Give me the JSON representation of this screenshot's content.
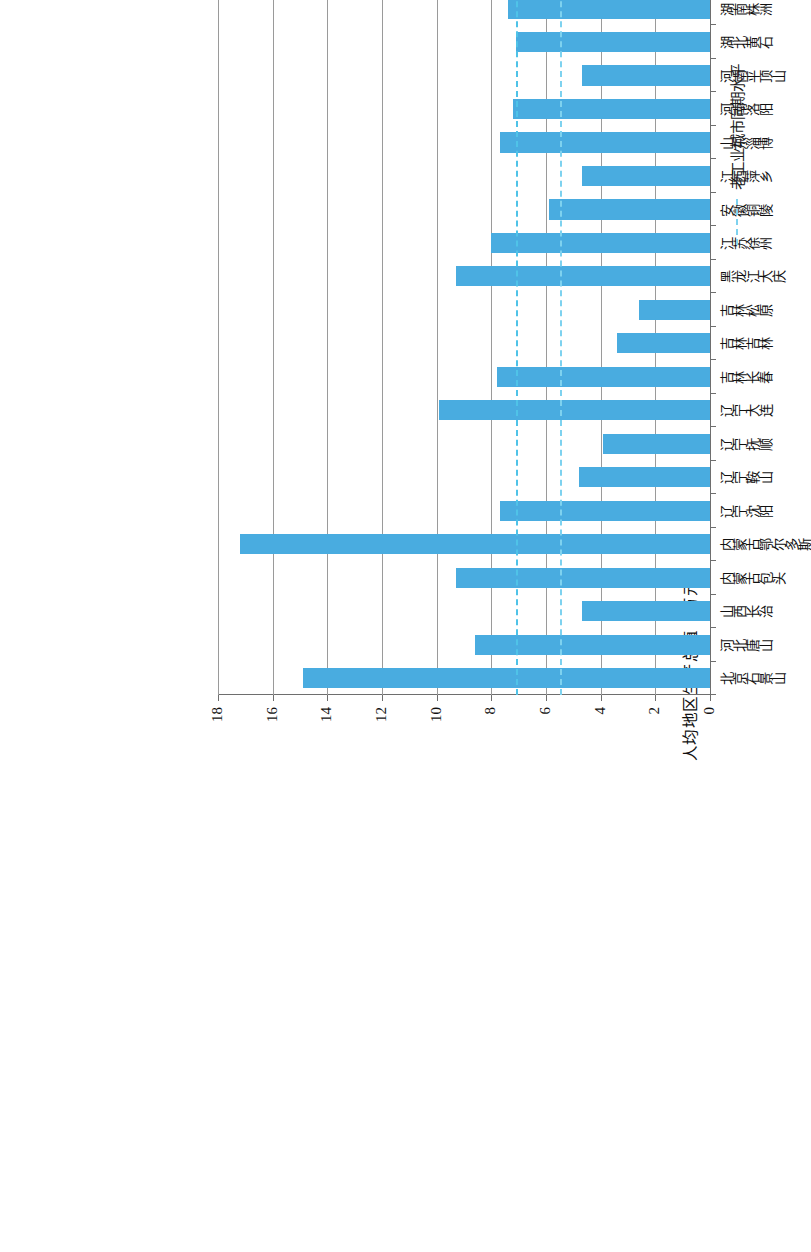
{
  "chart_data": {
    "type": "bar",
    "orientation": "horizontal-printed-sideways",
    "title": "",
    "xlabel": "",
    "ylabel": "人均地区生产总值（万元）",
    "ylim": [
      0,
      18
    ],
    "yticks": [
      "0",
      "2",
      "4",
      "6",
      "8",
      "10",
      "12",
      "14",
      "16",
      "18"
    ],
    "grid": true,
    "legend_position": "bottom-right",
    "categories": [
      "北京石景山",
      "河北唐山",
      "山西长治",
      "内蒙古包头",
      "内蒙古鄂尔多斯",
      "辽宁沈阳",
      "辽宁鞍山",
      "辽宁抚顺",
      "辽宁大连",
      "吉林长春",
      "吉林吉林",
      "吉林松原",
      "黑龙江大庆",
      "江苏徐州",
      "安徽铜陵",
      "江西萍乡",
      "山东淄博",
      "河南洛阳",
      "河南平顶山",
      "湖北黄石",
      "湖南株洲",
      "湖南湘潭",
      "湖南娄底",
      "广东韶关",
      "重庆永川",
      "重庆涪陵",
      "重庆江津",
      "重庆荣昌",
      "重庆长寿",
      "重庆铜梁",
      "重庆合川",
      "重庆沙坪坝",
      "四川自贡",
      "贵州六盘水",
      "宁夏石嘴山"
    ],
    "series": [
      {
        "name": "人均地区生产总值",
        "color": "#49ace0",
        "values": [
          14.9,
          8.6,
          4.7,
          9.3,
          17.2,
          7.7,
          4.8,
          3.9,
          9.9,
          7.8,
          3.4,
          2.6,
          9.3,
          8.0,
          5.9,
          4.7,
          7.7,
          7.2,
          4.7,
          7.1,
          7.4,
          7.8,
          4.1,
          4.3,
          8.8,
          10.1,
          7.4,
          9.0,
          8.1,
          8.4,
          6.4,
          8.4,
          4.8,
          4.3,
          6.8
        ]
      }
    ],
    "reference_lines": [
      {
        "name": "全国同期水平",
        "value": 7.1,
        "color": "#4fc3e8",
        "style": "dashed"
      },
      {
        "name": "老工业城市同期水平",
        "value": 5.5,
        "color": "#7ed2ef",
        "style": "dash-dot"
      }
    ]
  },
  "legend": {
    "items": [
      {
        "label": "人均地区生产总值",
        "marker": "bar-swatch"
      },
      {
        "label": "全国同期水平",
        "marker": "dashed-line"
      },
      {
        "label": "老工业城市同期水平",
        "marker": "dash-dot-line"
      }
    ]
  }
}
